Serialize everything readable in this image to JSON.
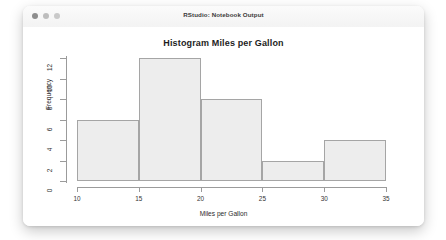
{
  "window": {
    "title": "RStudio: Notebook Output",
    "traffic_lights": [
      "close-dot",
      "minimize-dot",
      "zoom-dot"
    ]
  },
  "chart_data": {
    "type": "bar",
    "title": "Histogram Miles per Gallon",
    "xlabel": "Miles per Gallon",
    "ylabel": "Frequency",
    "categories": [
      "10-15",
      "15-20",
      "20-25",
      "25-30",
      "30-35"
    ],
    "bin_edges": [
      10,
      15,
      20,
      25,
      30,
      35
    ],
    "values": [
      6,
      12,
      8,
      2,
      4
    ],
    "xlim": [
      10,
      35
    ],
    "ylim": [
      0,
      12
    ],
    "xticks": [
      "10",
      "15",
      "20",
      "25",
      "30",
      "35"
    ],
    "yticks": [
      "0",
      "2",
      "4",
      "6",
      "8",
      "10",
      "12"
    ],
    "grid": false,
    "legend": "none",
    "bar_fill": "#ededed",
    "bar_border": "#a5a5a5",
    "axis_color": "#9b9b9b"
  }
}
